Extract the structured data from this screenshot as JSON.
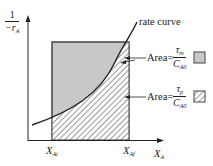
{
  "y_axis": {
    "label_numerator": "1",
    "label_denominator_prefix": "−r",
    "label_denominator_sub": "A"
  },
  "x_axis": {
    "label": "X",
    "label_sub": "A",
    "ticks": [
      {
        "label": "X",
        "sub": "Ai"
      },
      {
        "label": "X",
        "sub": "Af"
      }
    ]
  },
  "curve_label": "rate curve",
  "legend": [
    {
      "prefix": "Area=",
      "numerator": "τ",
      "numerator_sub": "m",
      "denominator": "C",
      "denominator_sub": "A0",
      "swatch": "grey-fill",
      "color": "#c8c8c8"
    },
    {
      "prefix": "Area=",
      "numerator": "τ",
      "numerator_sub": "p",
      "denominator": "C",
      "denominator_sub": "A0",
      "swatch": "hatched",
      "color": "#555555"
    }
  ],
  "colors": {
    "rect_fill": "#c8c8c8",
    "hatch": "#555555",
    "axis": "#222222"
  }
}
